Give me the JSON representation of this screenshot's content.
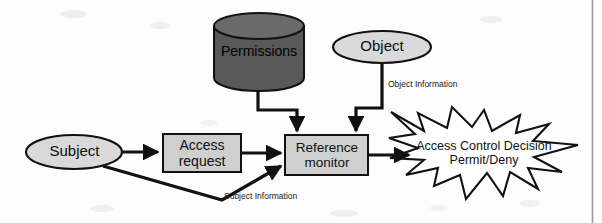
{
  "diagram": {
    "nodes": {
      "permissions": {
        "label": "Permissions",
        "shape": "cylinder",
        "fill": "#595959",
        "stroke": "#111111"
      },
      "object": {
        "label": "Object",
        "shape": "ellipse",
        "fill": "#d9d9d9",
        "stroke": "#111111"
      },
      "subject": {
        "label": "Subject",
        "shape": "ellipse",
        "fill": "#d9d9d9",
        "stroke": "#111111"
      },
      "access_request": {
        "label": "Access\nrequest",
        "shape": "rectangle",
        "fill": "#cfcfcf",
        "stroke": "#111111"
      },
      "reference_monitor": {
        "label": "Reference\nmonitor",
        "shape": "rectangle",
        "fill": "#cfcfcf",
        "stroke": "#111111"
      },
      "decision": {
        "label": "Access Control Decision\nPermit/Deny",
        "shape": "starburst",
        "fill": "#ffffff",
        "stroke": "#111111"
      }
    },
    "edge_labels": {
      "object_information": "Object Information",
      "subject_information": "Subject Information"
    },
    "edges": [
      {
        "from": "subject",
        "to": "access_request",
        "label": ""
      },
      {
        "from": "access_request",
        "to": "reference_monitor",
        "label": ""
      },
      {
        "from": "subject",
        "to": "reference_monitor",
        "label": "Subject Information"
      },
      {
        "from": "permissions",
        "to": "reference_monitor",
        "label": ""
      },
      {
        "from": "object",
        "to": "reference_monitor",
        "label": "Object Information"
      },
      {
        "from": "reference_monitor",
        "to": "decision",
        "label": ""
      }
    ],
    "colors": {
      "ink": "#111111",
      "page": "#fdfdfd",
      "cylinder_fill": "#595959",
      "node_fill_light": "#d9d9d9",
      "box_fill": "#cfcfcf",
      "rule": "#9a9a9a"
    }
  }
}
